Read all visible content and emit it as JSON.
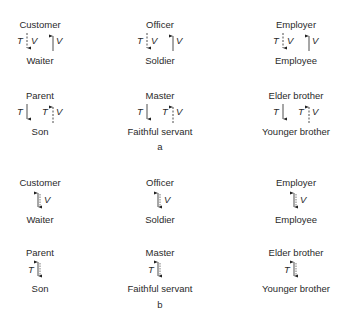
{
  "panels": [
    {
      "label": "a",
      "pairs": [
        {
          "top": "Customer",
          "bottom": "Waiter",
          "left_arrow": {
            "symbol": "T",
            "style": "dashed",
            "direction": "down",
            "extra": "V"
          },
          "right_arrow": {
            "symbol": "V",
            "style": "solid",
            "direction": "up"
          }
        },
        {
          "top": "Officer",
          "bottom": "Soldier",
          "left_arrow": {
            "symbol": "T",
            "style": "dashed",
            "direction": "down",
            "extra": "V"
          },
          "right_arrow": {
            "symbol": "V",
            "style": "solid",
            "direction": "up"
          }
        },
        {
          "top": "Employer",
          "bottom": "Employee",
          "left_arrow": {
            "symbol": "T",
            "style": "dashed",
            "direction": "down",
            "extra": "V"
          },
          "right_arrow": {
            "symbol": "V",
            "style": "solid",
            "direction": "up"
          }
        },
        {
          "top": "Parent",
          "bottom": "Son",
          "left_arrow": {
            "symbol": "T",
            "style": "solid",
            "direction": "down"
          },
          "right_arrow": {
            "symbol": "T",
            "style": "dashed",
            "direction": "up",
            "extra": "V"
          }
        },
        {
          "top": "Master",
          "bottom": "Faithful servant",
          "left_arrow": {
            "symbol": "T",
            "style": "solid",
            "direction": "down"
          },
          "right_arrow": {
            "symbol": "T",
            "style": "dashed",
            "direction": "up",
            "extra": "V"
          }
        },
        {
          "top": "Elder brother",
          "bottom": "Younger brother",
          "left_arrow": {
            "symbol": "T",
            "style": "solid",
            "direction": "down"
          },
          "right_arrow": {
            "symbol": "T",
            "style": "dashed",
            "direction": "up",
            "extra": "V"
          }
        }
      ]
    },
    {
      "label": "b",
      "pairs": [
        {
          "top": "Customer",
          "bottom": "Waiter",
          "arrow": {
            "symbol": "V",
            "direction": "both"
          }
        },
        {
          "top": "Officer",
          "bottom": "Soldier",
          "arrow": {
            "symbol": "V",
            "direction": "both"
          }
        },
        {
          "top": "Employer",
          "bottom": "Employee",
          "arrow": {
            "symbol": "V",
            "direction": "both"
          }
        },
        {
          "top": "Parent",
          "bottom": "Son",
          "arrow": {
            "symbol": "T",
            "direction": "both"
          }
        },
        {
          "top": "Master",
          "bottom": "Faithful servant",
          "arrow": {
            "symbol": "T",
            "direction": "both"
          }
        },
        {
          "top": "Elder brother",
          "bottom": "Younger brother",
          "arrow": {
            "symbol": "T",
            "direction": "both"
          }
        }
      ]
    }
  ],
  "symbols": {
    "T": "T",
    "V": "V"
  }
}
